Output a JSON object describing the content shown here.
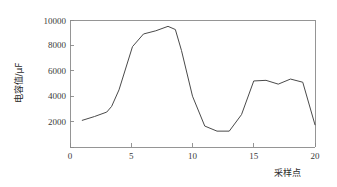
{
  "chart_data": {
    "type": "line",
    "title": "",
    "subtitle": "",
    "xlabel": "采样点",
    "ylabel": "电容值/μF",
    "xlim": [
      0,
      20
    ],
    "ylim": [
      0,
      10000
    ],
    "xticks": [
      "0",
      "5",
      "10",
      "15",
      "20"
    ],
    "xtick_values": [
      0,
      5,
      10,
      15,
      20
    ],
    "yticks": [
      "2000",
      "4000",
      "6000",
      "8000",
      "10000"
    ],
    "ytick_values": [
      2000,
      4000,
      6000,
      8000,
      10000
    ],
    "grid": false,
    "legend": null,
    "legend_position": "none",
    "line_color": "#4a4a4a",
    "axis_color": "#8a8a8a",
    "series": [
      {
        "name": "电容值",
        "x": [
          1.0,
          2.0,
          3.0,
          3.4,
          4.0,
          5.1,
          6.0,
          7.0,
          8.0,
          8.6,
          9.1,
          10.0,
          11.0,
          12.0,
          13.0,
          14.0,
          15.0,
          16.0,
          17.0,
          18.0,
          19.0,
          20.0
        ],
        "values": [
          2100,
          2400,
          2750,
          3200,
          4500,
          7900,
          8900,
          9150,
          9500,
          9250,
          7600,
          4000,
          1650,
          1250,
          1250,
          2550,
          5200,
          5250,
          4950,
          5350,
          5100,
          1750
        ]
      }
    ],
    "annotations": []
  },
  "figure": {
    "background": "#ffffff",
    "width": 337,
    "height": 187
  }
}
